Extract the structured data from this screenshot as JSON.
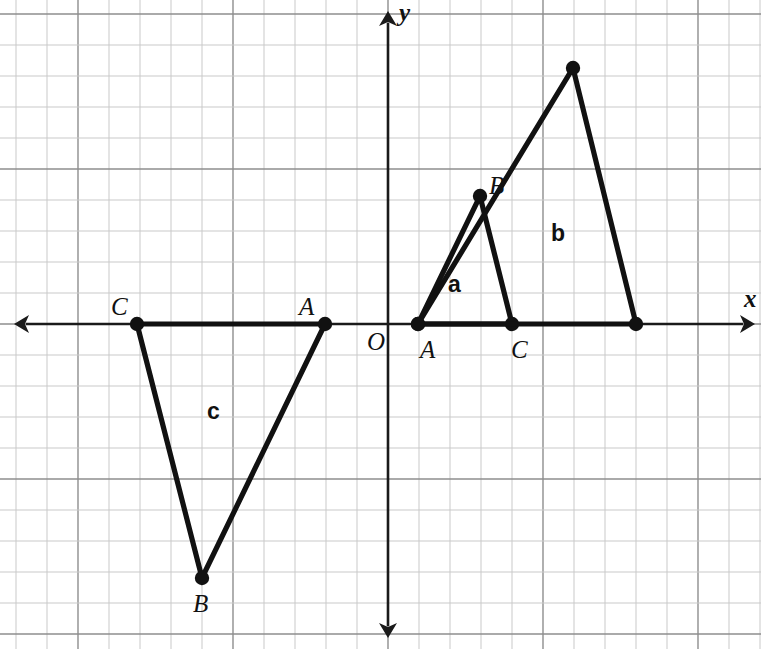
{
  "figure": {
    "width": 761,
    "height": 649,
    "background": "#ffffff",
    "grid": {
      "cell_px": 31.0,
      "minor_color": "#c9c9c9",
      "major_color": "#8e8e8e",
      "major_every": 5,
      "origin_px": {
        "x": 388,
        "y": 324
      }
    },
    "axes": {
      "x_axis": {
        "label": "x",
        "label_pos": {
          "x": 744,
          "y": 307
        },
        "y_px": 324,
        "from_px": 14,
        "to_px": 755,
        "arrows": [
          "left",
          "right"
        ],
        "color": "#1a1a1a"
      },
      "y_axis": {
        "label": "y",
        "label_pos": {
          "x": 399,
          "y": 21
        },
        "x_px": 388,
        "from_px": 11,
        "to_px": 638,
        "arrows": [
          "up",
          "down"
        ],
        "color": "#1a1a1a"
      },
      "origin_label": {
        "text": "O",
        "pos": {
          "x": 367,
          "y": 350
        }
      }
    }
  },
  "chart_data": {
    "type": "scatter",
    "title": "",
    "xlabel": "x",
    "ylabel": "y",
    "grid": true,
    "legend": "none",
    "unit_px": 31.0,
    "origin_px": {
      "x": 388,
      "y": 324
    },
    "xlim": [
      -12.1,
      11.8
    ],
    "ylim": [
      -10.5,
      10.1
    ],
    "shapes": [
      {
        "name": "a",
        "label": "a",
        "label_pos_px": {
          "x": 448,
          "y": 292
        },
        "label_grid": {
          "x": 1.94,
          "y": 1.03
        },
        "closed": true,
        "vertices": [
          {
            "label": "A",
            "px": {
              "x": 418,
              "y": 324
            },
            "grid": {
              "x": 1,
              "y": 0
            },
            "label_px": {
              "x": 420,
              "y": 358
            }
          },
          {
            "label": "B",
            "px": {
              "x": 480,
              "y": 196
            },
            "grid": {
              "x": 3,
              "y": 4
            },
            "label_px": {
              "x": 489,
              "y": 194
            }
          },
          {
            "label": "C",
            "px": {
              "x": 512,
              "y": 324
            },
            "grid": {
              "x": 4,
              "y": 0
            },
            "label_px": {
              "x": 511,
              "y": 358
            }
          }
        ]
      },
      {
        "name": "b",
        "label": "b",
        "label_pos_px": {
          "x": 551,
          "y": 241
        },
        "label_grid": {
          "x": 5.26,
          "y": 2.68
        },
        "closed": true,
        "vertices": [
          {
            "label": "",
            "px": {
              "x": 418,
              "y": 324
            },
            "grid": {
              "x": 1,
              "y": 0
            },
            "label_px": null
          },
          {
            "label": "",
            "px": {
              "x": 573,
              "y": 68
            },
            "grid": {
              "x": 6,
              "y": 8.26
            },
            "label_px": null
          },
          {
            "label": "",
            "px": {
              "x": 636,
              "y": 324
            },
            "grid": {
              "x": 8,
              "y": 0
            },
            "label_px": null
          }
        ]
      },
      {
        "name": "c",
        "label": "c",
        "label_pos_px": {
          "x": 207,
          "y": 419
        },
        "label_grid": {
          "x": -5.84,
          "y": -3.06
        },
        "closed": true,
        "vertices": [
          {
            "label": "C",
            "px": {
              "x": 137,
              "y": 324
            },
            "grid": {
              "x": -8,
              "y": 0
            },
            "label_px": {
              "x": 111,
              "y": 315
            }
          },
          {
            "label": "A",
            "px": {
              "x": 325,
              "y": 324
            },
            "grid": {
              "x": -2,
              "y": 0
            },
            "label_px": {
              "x": 299,
              "y": 315
            }
          },
          {
            "label": "B",
            "px": {
              "x": 202,
              "y": 578
            },
            "grid": {
              "x": -6,
              "y": -8.19
            },
            "label_px": {
              "x": 193,
              "y": 612
            }
          }
        ]
      }
    ]
  }
}
